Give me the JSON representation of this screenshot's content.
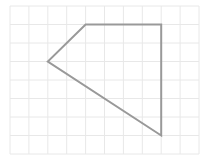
{
  "grid": {
    "columns": 10,
    "rows": 8,
    "origin": [
      10,
      6
    ],
    "cell_w": 18.9,
    "cell_h": 18.5,
    "line_color": "#e8e8e8"
  },
  "shape": {
    "type": "polygon",
    "vertices_grid": [
      [
        4,
        1
      ],
      [
        8,
        1
      ],
      [
        8,
        7
      ],
      [
        2,
        3
      ]
    ],
    "stroke": "#999999",
    "stroke_width": 2,
    "fill": "none"
  }
}
